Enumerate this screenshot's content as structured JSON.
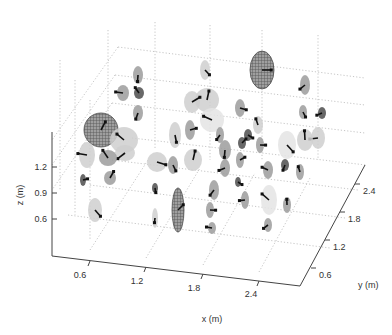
{
  "chart_data": {
    "type": "scatter3d",
    "title": "",
    "xlabel": "x (m)",
    "ylabel": "y (m)",
    "zlabel": "z (m)",
    "x_ticks": [
      "0.6",
      "1.2",
      "1.8",
      "2.4"
    ],
    "y_ticks": [
      "0.6",
      "1.2",
      "1.8",
      "2.4"
    ],
    "z_ticks": [
      "0.6",
      "0.9",
      "1.2"
    ],
    "xlim": [
      0.3,
      2.7
    ],
    "ylim": [
      0.3,
      2.7
    ],
    "zlim": [
      0.45,
      1.35
    ],
    "grid": true,
    "legend": null,
    "points": [
      {
        "px": 101,
        "py": 130,
        "rx": 17,
        "ry": 17,
        "shade": "wire",
        "note": "large wireframe sphere"
      },
      {
        "px": 262,
        "py": 70,
        "rx": 12,
        "ry": 19,
        "shade": "wire",
        "note": "large wireframe ellipsoid"
      },
      {
        "px": 178,
        "py": 210,
        "rx": 6,
        "ry": 22,
        "shade": "wire",
        "note": "elongated wireframe ellipsoid"
      },
      {
        "px": 138,
        "py": 75,
        "rx": 5,
        "ry": 9,
        "shade": "mid"
      },
      {
        "px": 123,
        "py": 93,
        "rx": 6,
        "ry": 8,
        "shade": "mid"
      },
      {
        "px": 139,
        "py": 93,
        "rx": 5,
        "ry": 6,
        "shade": "dark"
      },
      {
        "px": 138,
        "py": 113,
        "rx": 5,
        "ry": 8,
        "shade": "mid"
      },
      {
        "px": 205,
        "py": 70,
        "rx": 5,
        "ry": 10,
        "shade": "light"
      },
      {
        "px": 207,
        "py": 100,
        "rx": 12,
        "ry": 12,
        "shade": "light"
      },
      {
        "px": 192,
        "py": 102,
        "rx": 8,
        "ry": 11,
        "shade": "light"
      },
      {
        "px": 212,
        "py": 120,
        "rx": 12,
        "ry": 12,
        "shade": "vlight"
      },
      {
        "px": 240,
        "py": 108,
        "rx": 5,
        "ry": 9,
        "shade": "mid"
      },
      {
        "px": 258,
        "py": 125,
        "rx": 5,
        "ry": 9,
        "shade": "light"
      },
      {
        "px": 248,
        "py": 135,
        "rx": 4,
        "ry": 6,
        "shade": "dark"
      },
      {
        "px": 305,
        "py": 85,
        "rx": 5,
        "ry": 10,
        "shade": "mid"
      },
      {
        "px": 303,
        "py": 112,
        "rx": 4,
        "ry": 7,
        "shade": "mid"
      },
      {
        "px": 322,
        "py": 113,
        "rx": 4,
        "ry": 6,
        "shade": "dark"
      },
      {
        "px": 124,
        "py": 140,
        "rx": 14,
        "ry": 13,
        "shade": "light"
      },
      {
        "px": 87,
        "py": 155,
        "rx": 8,
        "ry": 13,
        "shade": "light"
      },
      {
        "px": 108,
        "py": 158,
        "rx": 9,
        "ry": 8,
        "shade": "mid"
      },
      {
        "px": 125,
        "py": 153,
        "rx": 10,
        "ry": 8,
        "shade": "light"
      },
      {
        "px": 175,
        "py": 135,
        "rx": 6,
        "ry": 13,
        "shade": "light"
      },
      {
        "px": 190,
        "py": 130,
        "rx": 5,
        "ry": 10,
        "shade": "mid"
      },
      {
        "px": 220,
        "py": 135,
        "rx": 4,
        "ry": 8,
        "shade": "mid"
      },
      {
        "px": 225,
        "py": 150,
        "rx": 6,
        "ry": 10,
        "shade": "mid"
      },
      {
        "px": 242,
        "py": 143,
        "rx": 4,
        "ry": 6,
        "shade": "dark"
      },
      {
        "px": 260,
        "py": 145,
        "rx": 4,
        "ry": 8,
        "shade": "mid"
      },
      {
        "px": 287,
        "py": 145,
        "rx": 9,
        "ry": 14,
        "shade": "vlight"
      },
      {
        "px": 305,
        "py": 140,
        "rx": 8,
        "ry": 11,
        "shade": "light"
      },
      {
        "px": 318,
        "py": 138,
        "rx": 7,
        "ry": 11,
        "shade": "light"
      },
      {
        "px": 157,
        "py": 162,
        "rx": 10,
        "ry": 10,
        "shade": "light"
      },
      {
        "px": 173,
        "py": 165,
        "rx": 5,
        "ry": 9,
        "shade": "mid"
      },
      {
        "px": 193,
        "py": 160,
        "rx": 9,
        "ry": 11,
        "shade": "light"
      },
      {
        "px": 225,
        "py": 168,
        "rx": 5,
        "ry": 9,
        "shade": "mid"
      },
      {
        "px": 240,
        "py": 160,
        "rx": 4,
        "ry": 8,
        "shade": "mid"
      },
      {
        "px": 268,
        "py": 170,
        "rx": 5,
        "ry": 9,
        "shade": "mid"
      },
      {
        "px": 285,
        "py": 165,
        "rx": 4,
        "ry": 6,
        "shade": "dark"
      },
      {
        "px": 300,
        "py": 172,
        "rx": 4,
        "ry": 8,
        "shade": "mid"
      },
      {
        "px": 83,
        "py": 180,
        "rx": 3,
        "ry": 6,
        "shade": "dark"
      },
      {
        "px": 110,
        "py": 178,
        "rx": 6,
        "ry": 7,
        "shade": "mid"
      },
      {
        "px": 155,
        "py": 188,
        "rx": 3,
        "ry": 5,
        "shade": "dark"
      },
      {
        "px": 214,
        "py": 190,
        "rx": 5,
        "ry": 10,
        "shade": "mid"
      },
      {
        "px": 238,
        "py": 182,
        "rx": 3,
        "ry": 5,
        "shade": "dark"
      },
      {
        "px": 245,
        "py": 200,
        "rx": 4,
        "ry": 9,
        "shade": "mid"
      },
      {
        "px": 210,
        "py": 210,
        "rx": 4,
        "ry": 8,
        "shade": "mid"
      },
      {
        "px": 269,
        "py": 200,
        "rx": 8,
        "ry": 15,
        "shade": "vlight"
      },
      {
        "px": 287,
        "py": 205,
        "rx": 4,
        "ry": 8,
        "shade": "mid"
      },
      {
        "px": 95,
        "py": 210,
        "rx": 7,
        "ry": 12,
        "shade": "light"
      },
      {
        "px": 155,
        "py": 218,
        "rx": 3,
        "ry": 10,
        "shade": "light"
      },
      {
        "px": 212,
        "py": 228,
        "rx": 4,
        "ry": 6,
        "shade": "mid"
      },
      {
        "px": 268,
        "py": 225,
        "rx": 4,
        "ry": 7,
        "shade": "mid"
      }
    ]
  }
}
